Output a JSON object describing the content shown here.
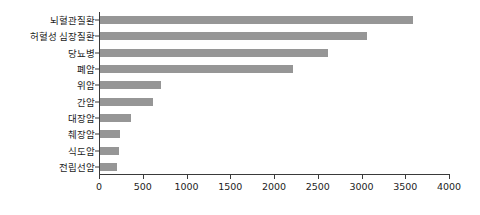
{
  "chart_data": {
    "type": "bar",
    "orientation": "horizontal",
    "title": "",
    "subtitle": "",
    "xlabel": "",
    "ylabel": "",
    "xlim": [
      0,
      4000
    ],
    "ylim": null,
    "grid": false,
    "legend": null,
    "legend_position": "none",
    "bar_color": "#969696",
    "axis_color": "#3a3a3a",
    "text_color": "#1d1d1d",
    "background_color": "#ffffff",
    "categories": [
      "뇌혈관질환",
      "허혈성 심장질환",
      "당뇨병",
      "폐암",
      "위암",
      "간암",
      "대장암",
      "췌장암",
      "식도암",
      "전립선암"
    ],
    "values": [
      3580,
      3050,
      2600,
      2200,
      700,
      600,
      350,
      230,
      215,
      195
    ],
    "xticks": [
      0,
      500,
      1000,
      1500,
      2000,
      2500,
      3000,
      3500,
      4000
    ],
    "xtick_labels": [
      "0",
      "500",
      "1000",
      "1500",
      "2000",
      "2500",
      "3000",
      "3500",
      "4000"
    ],
    "annotations": []
  }
}
